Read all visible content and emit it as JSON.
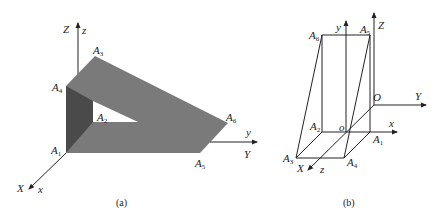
{
  "figures": [
    {
      "id": "a",
      "caption": "(a)",
      "axes": {
        "Z_upper": "Z",
        "z_lower": "z",
        "y_lower": "y",
        "Y_upper": "Y",
        "X_upper": "X",
        "x_lower": "x"
      },
      "vertices": [
        {
          "name": "A",
          "sub": "1"
        },
        {
          "name": "A",
          "sub": "2"
        },
        {
          "name": "A",
          "sub": "3"
        },
        {
          "name": "A",
          "sub": "4"
        },
        {
          "name": "A",
          "sub": "5"
        },
        {
          "name": "A",
          "sub": "6"
        }
      ],
      "colors": {
        "top_face": "#7a7a7a",
        "side_face": "#4a4a4a",
        "hole": "#ffffff"
      }
    },
    {
      "id": "b",
      "caption": "(b)",
      "axes": {
        "y_lower": "y",
        "Z_upper": "Z",
        "O_upper": "O",
        "Y_upper": "Y",
        "o_lower": "o",
        "x_lower": "x",
        "X_upper": "X",
        "z_lower": "z"
      },
      "vertices": [
        {
          "name": "A",
          "sub": "1"
        },
        {
          "name": "A",
          "sub": "2"
        },
        {
          "name": "A",
          "sub": "3"
        },
        {
          "name": "A",
          "sub": "4"
        },
        {
          "name": "A",
          "sub": "5"
        },
        {
          "name": "A",
          "sub": "6"
        }
      ]
    }
  ]
}
